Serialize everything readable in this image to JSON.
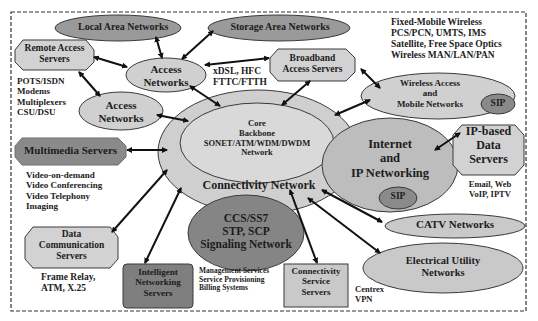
{
  "colors": {
    "light_fill": "#d4d4d4",
    "mid_fill": "#bdbdbd",
    "dark_fill": "#8a8a8a",
    "darker_fill": "#7a7a7a",
    "stroke": "#3a3a3a",
    "arrow": "#111111",
    "border": "#333333"
  },
  "nodes": {
    "lan": {
      "label": "Local Area Networks"
    },
    "san": {
      "label": "Storage Area Networks"
    },
    "remote_access": {
      "label": "Remote Access\nServers"
    },
    "access1": {
      "label": "Access\nNetworks"
    },
    "access2": {
      "label": "Access\nNetworks"
    },
    "broadband": {
      "label": "Broadband\nAccess Servers"
    },
    "wireless": {
      "label": "Wireless Access\nand\nMobile Networks"
    },
    "wireless_sip": {
      "label": "SIP"
    },
    "multimedia": {
      "label": "Multimedia Servers"
    },
    "core": {
      "label": "Core\nBackbone\nSONET/ATM/WDM/DWDM\nNetwork"
    },
    "connectivity": {
      "label": "Connectivity Network"
    },
    "internet": {
      "label": "Internet\nand\nIP Networking"
    },
    "internet_sip": {
      "label": "SIP"
    },
    "ip_data": {
      "label": "IP-based\nData\nServers"
    },
    "signaling": {
      "label": "CCS/SS7\nSTP, SCP\nSignaling Network"
    },
    "data_comm": {
      "label": "Data\nCommunication\nServers"
    },
    "intelligent": {
      "label": "Intelligent\nNetworking\nServers"
    },
    "conn_service": {
      "label": "Connectivity\nService\nServers"
    },
    "catv": {
      "label": "CATV Networks"
    },
    "electrical": {
      "label": "Electrical Utility\nNetworks"
    }
  },
  "annotations": {
    "remote_access_list": "POTS/ISDN\nModems\nMultiplexers\nCSU/DSU",
    "xdsl": "xDSL, HFC\nFTTC/FTTH",
    "wireless_list": "Fixed-Mobile Wireless\nPCS/PCN, UMTS, IMS\nSatellite, Free Space Optics\nWireless MAN/LAN/PAN",
    "multimedia_list": "Video-on-demand\nVideo Conferencing\nVideo Telephony\nImaging",
    "ip_data_list": "Email, Web\nVoIP, IPTV",
    "data_comm_list": "Frame Relay,\nATM, X.25",
    "intelligent_list": "Management Services\nService Provisioning\nBilling Systems",
    "conn_service_list": "Centrex\nVPN"
  }
}
